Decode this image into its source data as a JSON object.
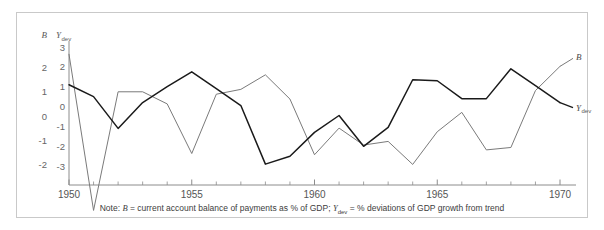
{
  "figure": {
    "note_prefix": "Note:",
    "note_b_def": "= current account balance of payments as % of GDP;",
    "note_y_def": "= % deviations of GDP growth from trend",
    "symbol_b": "B",
    "symbol_y": "Y",
    "symbol_y_sub": "dev",
    "left_axis_title": "B",
    "right_axis_title": "Y",
    "right_axis_title_sub": "dev",
    "end_label_b": "B",
    "end_label_y": "Y",
    "end_label_y_sub": "dev",
    "colors": {
      "series_b": "#7a7a7a",
      "series_ydev": "#1a1a1a",
      "axis": "#8c8c8c",
      "frame": "#c9c9c9",
      "text": "#555555"
    }
  },
  "chart_data": {
    "type": "line",
    "title": "",
    "xlabel": "",
    "ylabel": "B",
    "y2label": "Y_dev",
    "grid": false,
    "legend_position": "line-end-labels",
    "x": [
      1950,
      1951,
      1952,
      1953,
      1954,
      1955,
      1956,
      1957,
      1958,
      1959,
      1960,
      1961,
      1962,
      1963,
      1964,
      1965,
      1966,
      1967,
      1968,
      1969,
      1970
    ],
    "xlim": [
      1950,
      1970
    ],
    "xticks": [
      1950,
      1955,
      1960,
      1965,
      1970
    ],
    "xtick_labels": [
      "1950",
      "1955",
      "1960",
      "1965",
      "1970"
    ],
    "xminor_ticks": [
      1951,
      1952,
      1953,
      1954,
      1956,
      1957,
      1958,
      1959,
      1961,
      1962,
      1963,
      1964,
      1966,
      1967,
      1968,
      1969
    ],
    "left_axis": {
      "label": "B",
      "ylim": [
        -2.85,
        2.85
      ],
      "yticks": [
        2,
        1,
        0,
        -1,
        -2
      ],
      "ytick_labels": [
        "2",
        "1",
        "0",
        "-1",
        "-2"
      ]
    },
    "right_axis": {
      "label": "Y_dev",
      "ylim": [
        -3.95,
        3.0
      ],
      "yticks": [
        3,
        2,
        1,
        0,
        -1,
        -2,
        -3
      ],
      "ytick_labels": [
        "3",
        "2",
        "1",
        "0",
        "-1",
        "-2",
        "-3"
      ]
    },
    "series": [
      {
        "name": "B",
        "axis": "left",
        "color": "#7a7a7a",
        "end_label": "B",
        "values": [
          2.55,
          -3.9,
          1.0,
          1.0,
          0.5,
          -1.55,
          0.9,
          1.1,
          1.7,
          0.7,
          -1.6,
          -0.5,
          -1.2,
          -1.05,
          -2.0,
          -0.65,
          0.15,
          -1.4,
          -1.3,
          1.05,
          2.05
        ]
      },
      {
        "name": "Y_dev",
        "axis": "right",
        "color": "#1a1a1a",
        "end_label": "Y_dev",
        "values": [
          1.1,
          0.5,
          -1.1,
          0.2,
          1.0,
          1.75,
          0.9,
          0.05,
          -2.9,
          -2.5,
          -1.3,
          -0.45,
          -2.0,
          -1.05,
          1.35,
          1.3,
          0.4,
          0.4,
          1.9,
          1.05,
          0.2
        ]
      }
    ]
  }
}
